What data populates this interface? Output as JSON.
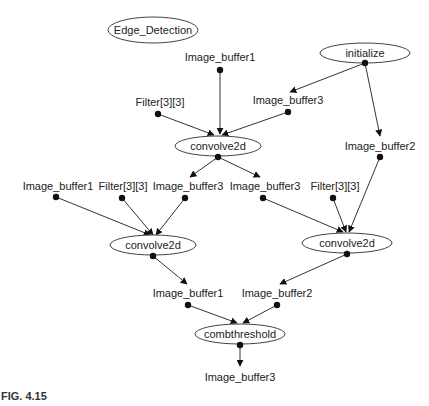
{
  "figure_caption": "FIG. 4.15",
  "nodes": {
    "edge_detection": {
      "label": "Edge_Detection"
    },
    "initialize": {
      "label": "initialize"
    },
    "convolve_top": {
      "label": "convolve2d"
    },
    "convolve_left": {
      "label": "convolve2d"
    },
    "convolve_right": {
      "label": "convolve2d"
    },
    "combthreshold": {
      "label": "combthreshold"
    }
  },
  "ports": {
    "top_image_buffer1": {
      "label": "Image_buffer1"
    },
    "top_filter": {
      "label": "Filter[3][3]"
    },
    "top_image_buffer3": {
      "label": "Image_buffer3"
    },
    "right_image_buffer2": {
      "label": "Image_buffer2"
    },
    "left_image_buffer1": {
      "label": "Image_buffer1"
    },
    "left_filter": {
      "label": "Filter[3][3]"
    },
    "left_image_buffer3": {
      "label": "Image_buffer3"
    },
    "right_image_buffer3": {
      "label": "Image_buffer3"
    },
    "right_filter": {
      "label": "Filter[3][3]"
    },
    "out_image_buffer1": {
      "label": "Image_buffer1"
    },
    "out_image_buffer2": {
      "label": "Image_buffer2"
    },
    "final_image_buffer3": {
      "label": "Image_buffer3"
    }
  },
  "colors": {
    "stroke": "#444444",
    "text": "#222222",
    "background": "#ffffff"
  }
}
